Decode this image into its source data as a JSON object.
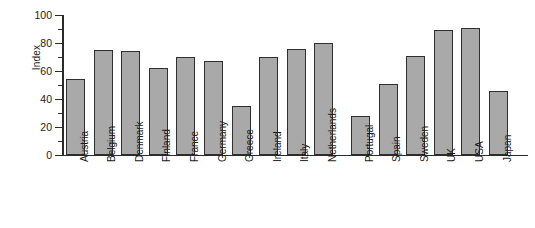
{
  "chart_data": {
    "type": "bar",
    "title": "",
    "xlabel": "",
    "ylabel": "Index",
    "ylim": [
      0,
      100
    ],
    "ytick_labels": [
      "0",
      "20",
      "40",
      "60",
      "80",
      "100"
    ],
    "ytick_values": [
      0,
      20,
      40,
      60,
      80,
      100
    ],
    "yminor_values": [
      10,
      30,
      50,
      70,
      90
    ],
    "grid": false,
    "legend": false,
    "categories": [
      "Austria",
      "Belgium",
      "Denmark",
      "Finland",
      "France",
      "Germany",
      "Greece",
      "Ireland",
      "Italy",
      "Netherlands",
      "Portugal",
      "Spain",
      "Sweden",
      "UK",
      "USA",
      "Japan"
    ],
    "values": [
      54,
      75,
      74,
      62,
      70,
      67,
      35,
      70,
      76,
      80,
      28,
      51,
      71,
      89,
      91,
      46
    ],
    "bar_fill_color": "#a9a9a9",
    "bar_edge_color": "#2f2f2f",
    "axis_color": "#2a2a2a",
    "background_color": "#ffffff"
  }
}
